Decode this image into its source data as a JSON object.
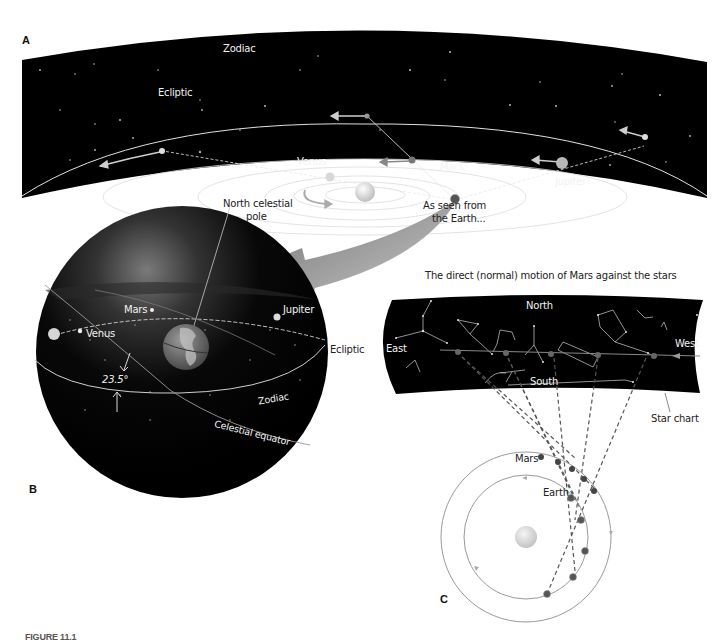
{
  "figure": {
    "panel_labels": {
      "a": "A",
      "b": "B",
      "c": "C"
    },
    "caption_partial": "FIGURE 11.1"
  },
  "panel_a": {
    "zodiac": "Zodiac",
    "ecliptic": "Ecliptic",
    "venus": "Venus",
    "mars": "Mars",
    "jupiter": "Jupiter",
    "earth": "Earth"
  },
  "transition": {
    "as_seen_line1": "As seen from",
    "as_seen_line2": "the Earth..."
  },
  "panel_b": {
    "ncp_line1": "North celestial",
    "ncp_line2": "pole",
    "mars": "Mars",
    "jupiter": "Jupiter",
    "venus": "Venus",
    "ecliptic": "Ecliptic",
    "angle": "23.5°",
    "zodiac": "Zodiac",
    "celestial_equator": "Celestial equator"
  },
  "panel_c": {
    "title": "The direct (normal) motion of Mars against the stars",
    "north": "North",
    "south": "South",
    "east": "East",
    "west": "West",
    "star_chart": "Star chart",
    "mars": "Mars",
    "earth": "Earth"
  },
  "colors": {
    "sky": "#000000",
    "orbit": "#e6e6e6",
    "arrow_gray": "#9a9a9a",
    "planet": "#cfcfcf",
    "mars_dot": "#555555"
  }
}
